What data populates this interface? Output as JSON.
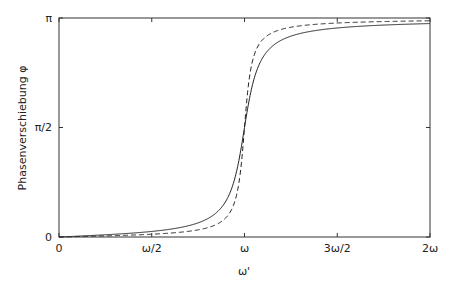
{
  "chart_data": {
    "type": "line",
    "title": "",
    "xlabel": "ω'",
    "ylabel": "Phasenverschiebung φ",
    "xlim": [
      0,
      2
    ],
    "ylim": [
      0,
      3.14159
    ],
    "x_ticks": [
      {
        "value": 0,
        "label": "0"
      },
      {
        "value": 0.5,
        "label": "ω/2"
      },
      {
        "value": 1,
        "label": "ω"
      },
      {
        "value": 1.5,
        "label": "3ω/2"
      },
      {
        "value": 2,
        "label": "2ω"
      }
    ],
    "y_ticks": [
      {
        "value": 0,
        "label": "0"
      },
      {
        "value": 1.5708,
        "label": "π/2"
      },
      {
        "value": 3.14159,
        "label": "π"
      }
    ],
    "grid": false,
    "legend": null,
    "series": [
      {
        "name": "solid",
        "style": "solid",
        "damping_ratio": 0.06,
        "x": [
          0,
          0.25,
          0.5,
          0.75,
          0.9,
          1.0,
          1.1,
          1.25,
          1.5,
          1.75,
          2.0
        ],
        "y": [
          0,
          0.032,
          0.08,
          0.199,
          0.55,
          1.571,
          2.62,
          2.9,
          2.997,
          3.03,
          3.062
        ]
      },
      {
        "name": "dashed",
        "style": "dashed",
        "damping_ratio": 0.03,
        "x": [
          0,
          0.25,
          0.5,
          0.75,
          0.9,
          1.0,
          1.1,
          1.25,
          1.5,
          1.75,
          2.0
        ],
        "y": [
          0,
          0.016,
          0.04,
          0.102,
          0.28,
          1.571,
          2.86,
          3.02,
          3.07,
          3.09,
          3.1
        ]
      }
    ]
  }
}
